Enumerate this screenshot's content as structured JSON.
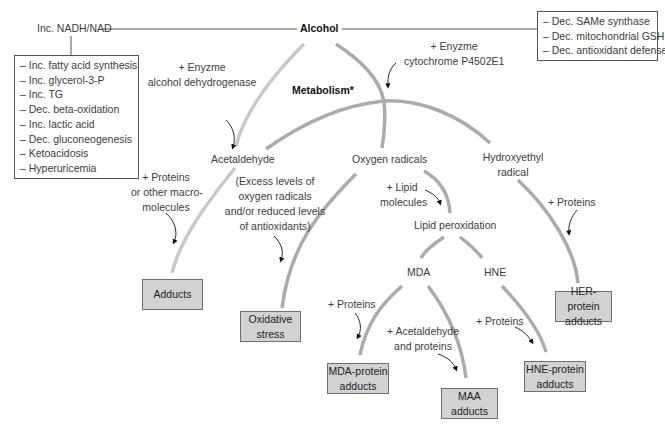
{
  "root": {
    "label": "Alcohol"
  },
  "left_effect": {
    "label": "Inc. NADH/NAD",
    "items": [
      "Inc. fatty acid synthesis",
      "Inc. glycerol-3-P",
      "Inc. TG",
      "Dec. beta-oxidation",
      "Inc. lactic acid",
      "Dec. gluconeogenesis",
      "Ketoacidosis",
      "Hyperuricemia"
    ]
  },
  "right_effect": {
    "items": [
      "Dec. SAMe synthase",
      "Dec. mitochondrial GSH",
      "Dec. antioxidant defense"
    ]
  },
  "enzymes": {
    "adh": [
      "+ Enyzme",
      "alcohol dehydrogenase"
    ],
    "cyp": [
      "+ Enyzme",
      "cytochrome P4502E1"
    ]
  },
  "metabolism_label": "Metabolism*",
  "intermediates": {
    "acetaldehyde": "Acetaldehyde",
    "oxygen_radicals": "Oxygen radicals",
    "hydroxyethyl": [
      "Hydroxyethyl",
      "radical"
    ],
    "lipid_peroxidation": "Lipid peroxidation",
    "mda": "MDA",
    "hne": "HNE"
  },
  "annotations": {
    "proteins_macro": [
      "+ Proteins",
      "or other macro-",
      "molecules"
    ],
    "excess": [
      "(Excess levels of",
      "oxygen radicals",
      "and/or reduced levels",
      "of antioxidants)"
    ],
    "lipid_molecules": [
      "+ Lipid",
      "molecules"
    ],
    "proteins_her": "+ Proteins",
    "proteins_mda": "+ Proteins",
    "acetaldehyde_proteins": [
      "+ Acetaldehyde",
      "and proteins"
    ],
    "proteins_hne": "+ Proteins"
  },
  "outcomes": {
    "adducts": [
      "Adducts"
    ],
    "oxidative_stress": [
      "Oxidative",
      "stress"
    ],
    "her_protein": [
      "HER-protein",
      "adducts"
    ],
    "mda_protein": [
      "MDA-protein",
      "adducts"
    ],
    "maa": [
      "MAA",
      "adducts"
    ],
    "hne_protein": [
      "HNE-protein",
      "adducts"
    ]
  },
  "colors": {
    "line_light": "#c4c4c4",
    "line_mid": "#a9a9a9",
    "box_fill": "#d2d2d2",
    "box_border": "#6f6f6f"
  }
}
